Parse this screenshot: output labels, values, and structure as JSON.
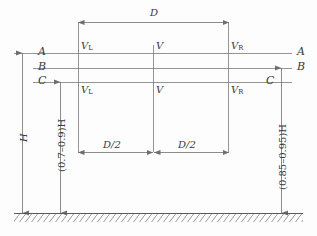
{
  "figure": {
    "background_color": "#fdfdfd",
    "line_color": "#6e6e6e",
    "text_color": "#3a3a3a"
  },
  "dimensions": {
    "top_span": {
      "label": "D",
      "name": "overall-width"
    },
    "bottom_left_half": {
      "label": "D/2",
      "name": "left-half-width"
    },
    "bottom_right_half": {
      "label": "D/2",
      "name": "right-half-width"
    },
    "left_full_height": {
      "label": "H",
      "name": "total-height"
    },
    "left_partial_height": {
      "label": "(0.7–0.9)H",
      "name": "lower-height-range"
    },
    "right_partial_height": {
      "label": "(0.85–0.95)H",
      "name": "upper-height-range"
    }
  },
  "level_lines": [
    {
      "label": "A",
      "left_label": "A",
      "right_label": "A",
      "name": "level-line-a"
    },
    {
      "label": "B",
      "left_label": "B",
      "right_label": "B",
      "name": "level-line-b"
    },
    {
      "label": "C",
      "left_label": "C",
      "right_label": "C",
      "name": "level-line-c"
    }
  ],
  "velocity_labels": {
    "upper_row": [
      {
        "base": "V",
        "subscript": "L",
        "name": "velocity-left-upper"
      },
      {
        "base": "V",
        "subscript": "",
        "name": "velocity-center-upper"
      },
      {
        "base": "V",
        "subscript": "R",
        "name": "velocity-right-upper"
      }
    ],
    "lower_row": [
      {
        "base": "V",
        "subscript": "L",
        "name": "velocity-left-lower"
      },
      {
        "base": "V",
        "subscript": "",
        "name": "velocity-center-lower"
      },
      {
        "base": "V",
        "subscript": "R",
        "name": "velocity-right-lower"
      }
    ]
  },
  "ground": {
    "name": "ground-hatching",
    "style": "diagonal-hatch"
  }
}
